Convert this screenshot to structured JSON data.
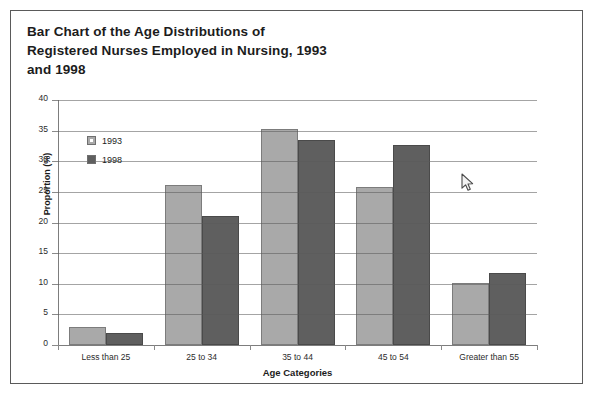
{
  "card": {
    "border_color": "#5a5a5a",
    "background": "#ffffff"
  },
  "title": "Bar Chart of the Age Distributions of\nRegistered Nurses Employed in Nursing, 1993\nand 1998",
  "cursor": {
    "name": "arrow-pointer",
    "x": 461,
    "y": 173
  },
  "legend": {
    "position": "top-left-inside",
    "entries": [
      {
        "label": "1993",
        "color": "#a9a9a9"
      },
      {
        "label": "1998",
        "color": "#5f5f5f"
      }
    ]
  },
  "axes": {
    "y_ticks": [
      "0",
      "5",
      "10",
      "15",
      "20",
      "25",
      "30",
      "35",
      "40"
    ],
    "x_title": "Age Categories",
    "y_title": "Proportion (%)"
  },
  "chart_data": {
    "type": "bar",
    "title": "Bar Chart of the Age Distributions of Registered Nurses Employed in Nursing, 1993 and 1998",
    "xlabel": "Age Categories",
    "ylabel": "Proportion (%)",
    "ylim": [
      0,
      40
    ],
    "yticks": [
      0,
      5,
      10,
      15,
      20,
      25,
      30,
      35,
      40
    ],
    "grid": true,
    "legend_position": "upper left",
    "categories": [
      "Less than 25",
      "25 to 34",
      "35 to 44",
      "45 to 54",
      "Greater than 55"
    ],
    "series": [
      {
        "name": "1993",
        "color": "#a9a9a9",
        "values": [
          2.9,
          26.1,
          35.2,
          25.8,
          10.1
        ]
      },
      {
        "name": "1998",
        "color": "#5f5f5f",
        "values": [
          2.0,
          21.0,
          33.4,
          32.6,
          11.8
        ]
      }
    ]
  }
}
